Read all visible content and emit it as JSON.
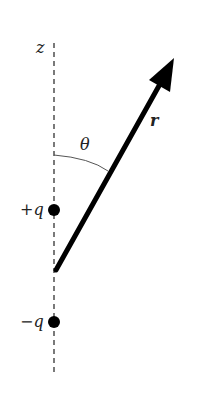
{
  "diagram": {
    "axis_label": "z",
    "vector_label": "r",
    "angle_label": "θ",
    "charges": [
      {
        "label": "+q",
        "sign": "positive"
      },
      {
        "label": "−q",
        "sign": "negative"
      }
    ]
  }
}
